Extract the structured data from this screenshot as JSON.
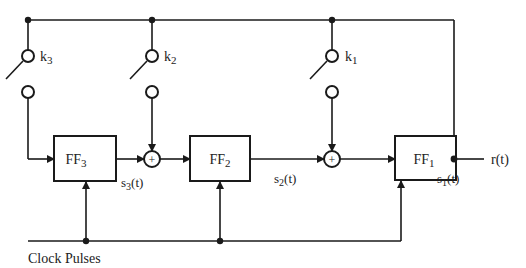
{
  "diagram": {
    "type": "linear feedback shift register",
    "flip_flops": [
      {
        "id": "ff3",
        "label": "FF",
        "sub": "3",
        "output": {
          "label": "s",
          "sub": "3",
          "suffix": "(t)"
        }
      },
      {
        "id": "ff2",
        "label": "FF",
        "sub": "2",
        "output": {
          "label": "s",
          "sub": "2",
          "suffix": "(t)"
        }
      },
      {
        "id": "ff1",
        "label": "FF",
        "sub": "1",
        "output": {
          "label": "s",
          "sub": "1",
          "suffix": "(t)"
        }
      }
    ],
    "switches": [
      {
        "id": "k3",
        "label": "k",
        "sub": "3"
      },
      {
        "id": "k2",
        "label": "k",
        "sub": "2"
      },
      {
        "id": "k1",
        "label": "k",
        "sub": "1"
      }
    ],
    "adders": [
      {
        "id": "adder-1",
        "symbol": "+"
      },
      {
        "id": "adder-2",
        "symbol": "+"
      }
    ],
    "output_label": "r(t)",
    "clock_label": "Clock Pulses"
  },
  "colors": {
    "line": "#1a1a1a",
    "background": "#ffffff"
  }
}
